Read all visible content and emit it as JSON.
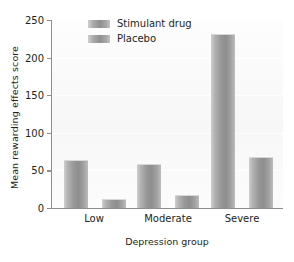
{
  "chart_data": {
    "type": "bar",
    "title": "",
    "xlabel": "Depression group",
    "ylabel": "Mean rewarding effects score",
    "categories": [
      "Low",
      "Moderate",
      "Severe"
    ],
    "series": [
      {
        "name": "Stimulant drug",
        "values": [
          64,
          58,
          230
        ],
        "color": "#989898"
      },
      {
        "name": "Placebo",
        "values": [
          12,
          17,
          68
        ],
        "color": "#989898"
      }
    ],
    "ylim": [
      0,
      250
    ],
    "yticks": [
      0,
      50,
      100,
      150,
      200,
      250
    ],
    "ytick_labels": [
      "0",
      "50",
      "100",
      "150",
      "200",
      "250"
    ],
    "grid": true,
    "legend_position": "top-left-inside"
  },
  "legend": {
    "items": [
      {
        "label": "Stimulant drug"
      },
      {
        "label": "Placebo"
      }
    ]
  },
  "axes": {
    "y_title": "Mean rewarding effects score",
    "x_title": "Depression group"
  }
}
